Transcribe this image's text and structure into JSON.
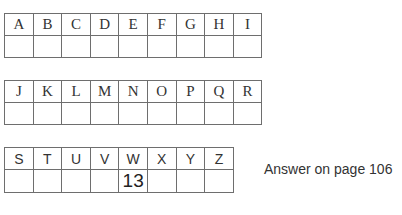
{
  "grids": [
    {
      "letters": [
        "A",
        "B",
        "C",
        "D",
        "E",
        "F",
        "G",
        "H",
        "I"
      ],
      "values": [
        "",
        "",
        "",
        "",
        "",
        "",
        "",
        "",
        ""
      ]
    },
    {
      "letters": [
        "J",
        "K",
        "L",
        "M",
        "N",
        "O",
        "P",
        "Q",
        "R"
      ],
      "values": [
        "",
        "",
        "",
        "",
        "",
        "",
        "",
        "",
        ""
      ]
    },
    {
      "letters": [
        "S",
        "T",
        "U",
        "V",
        "W",
        "X",
        "Y",
        "Z"
      ],
      "values": [
        "",
        "",
        "",
        "",
        "13",
        "",
        "",
        ""
      ]
    }
  ],
  "answer_note": "Answer on page 106"
}
